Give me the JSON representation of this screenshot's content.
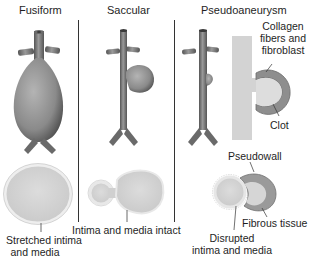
{
  "figure": {
    "panels": [
      {
        "id": "fusiform",
        "title": "Fusiform",
        "labels": [
          "Stretched intima",
          "and media"
        ]
      },
      {
        "id": "saccular",
        "title": "Saccular",
        "labels": [
          "Intima and media intact"
        ]
      },
      {
        "id": "pseudoaneurysm",
        "title": "Pseudoaneurysm",
        "labels": {
          "collagen": [
            "Collagen",
            "fibers and",
            "fibroblast"
          ],
          "clot": "Clot",
          "pseudowall": "Pseudowall",
          "fibrous": "Fibrous tissue",
          "disrupted": [
            "Disrupted",
            "intima and media"
          ]
        }
      }
    ],
    "colors": {
      "vessel_dark": "#5e5e5e",
      "vessel_light": "#a8a8a8",
      "section_fill": "#d6d6d6",
      "divider": "#333333"
    }
  }
}
